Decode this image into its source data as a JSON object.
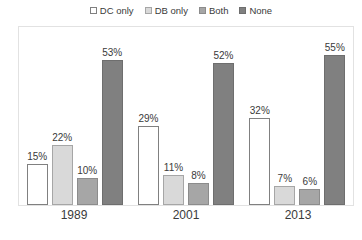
{
  "chart_data": {
    "type": "bar",
    "title": "",
    "subtitle": "",
    "xlabel": "",
    "ylabel": "",
    "grid": false,
    "legend_position": "top",
    "ylim": [
      0,
      60
    ],
    "value_suffix": "%",
    "categories": [
      "1989",
      "2001",
      "2013"
    ],
    "series": [
      {
        "name": "DC only",
        "color": "#ffffff",
        "border": "#808080",
        "values": [
          15,
          29,
          32
        ],
        "labels": [
          "15%",
          "29%",
          "32%"
        ]
      },
      {
        "name": "DB only",
        "color": "#d9d9d9",
        "border": "#a6a6a6",
        "values": [
          22,
          11,
          7
        ],
        "labels": [
          "22%",
          "11%",
          "7%"
        ]
      },
      {
        "name": "Both",
        "color": "#a6a6a6",
        "border": "#8c8c8c",
        "values": [
          10,
          8,
          6
        ],
        "labels": [
          "10%",
          "8%",
          "6%"
        ]
      },
      {
        "name": "None",
        "color": "#808080",
        "border": "#6e6e6e",
        "values": [
          53,
          52,
          55
        ],
        "labels": [
          "53%",
          "52%",
          "55%"
        ]
      }
    ]
  },
  "legend": {
    "items": [
      {
        "label": "DC only",
        "swatch": "#ffffff",
        "swatch_border": "#808080"
      },
      {
        "label": "DB only",
        "swatch": "#d9d9d9",
        "swatch_border": "#a6a6a6"
      },
      {
        "label": "Both",
        "swatch": "#a6a6a6",
        "swatch_border": "#8c8c8c"
      },
      {
        "label": "None",
        "swatch": "#808080",
        "swatch_border": "#6e6e6e"
      }
    ]
  },
  "axis": {
    "categories": [
      "1989",
      "2001",
      "2013"
    ]
  }
}
